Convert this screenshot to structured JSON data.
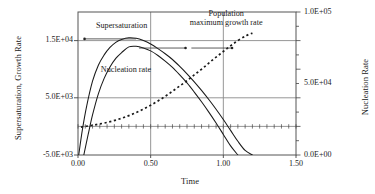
{
  "chart_data": {
    "type": "line",
    "title": "",
    "xlabel": "Time",
    "ylabel": "Supersaturation, Growth Rate",
    "ylabel_right": "Nucleation Rate",
    "xlim": [
      0.0,
      1.5
    ],
    "ylim": [
      -5000,
      20000
    ],
    "ylim_right": [
      0,
      100000
    ],
    "grid": true,
    "legend_position": "inline-annotations",
    "xticks": [
      "0.00",
      "0.50",
      "1.00",
      "1.50"
    ],
    "xtick_values": [
      0.0,
      0.5,
      1.0,
      1.5
    ],
    "yticks_left": [
      "-5.0E+03",
      "5.0E+03",
      "1.5E+04"
    ],
    "ytick_values_left": [
      -5000,
      5000,
      15000
    ],
    "yticks_right": [
      "0.0E+00",
      "5.0E+04",
      "1.0E+05"
    ],
    "ytick_values_right": [
      0,
      50000,
      100000
    ],
    "series": [
      {
        "name": "Supersaturation",
        "style": "solid",
        "axis": "left",
        "peak_x": 0.35,
        "peak_y": 15500,
        "x": [
          0.005,
          0.03,
          0.06,
          0.1,
          0.14,
          0.18,
          0.22,
          0.26,
          0.3,
          0.35,
          0.4,
          0.45,
          0.5,
          0.55,
          0.6,
          0.65,
          0.7,
          0.75,
          0.8,
          0.85,
          0.9,
          0.95,
          1.0,
          1.05,
          1.1,
          1.15,
          1.2
        ],
        "y": [
          -5000,
          -600,
          3600,
          7900,
          10700,
          12500,
          13800,
          14700,
          15200,
          15500,
          15400,
          15000,
          14400,
          13600,
          12700,
          11700,
          10500,
          9200,
          7800,
          6300,
          4700,
          3000,
          1200,
          -700,
          -2600,
          -4200,
          -5000
        ]
      },
      {
        "name": "Nucleation rate",
        "style": "solid",
        "axis": "right",
        "peak_x": 0.36,
        "peak_y": 14000,
        "x": [
          0.04,
          0.07,
          0.1,
          0.14,
          0.18,
          0.22,
          0.26,
          0.3,
          0.35,
          0.4,
          0.45,
          0.5,
          0.55,
          0.6,
          0.65,
          0.7,
          0.75,
          0.8,
          0.85,
          0.9,
          0.95,
          1.0,
          1.05,
          1.1
        ],
        "y": [
          -5000,
          -1400,
          2000,
          5700,
          8400,
          10400,
          11900,
          12900,
          13900,
          14000,
          13700,
          13200,
          12400,
          11400,
          10300,
          9000,
          7600,
          6000,
          4300,
          2500,
          600,
          -1400,
          -3400,
          -5000
        ]
      },
      {
        "name": "Population maximum growth rate",
        "style": "dotted",
        "axis": "left",
        "x": [
          0.02,
          0.08,
          0.14,
          0.2,
          0.26,
          0.32,
          0.38,
          0.44,
          0.5,
          0.56,
          0.62,
          0.68,
          0.74,
          0.8,
          0.86,
          0.92,
          0.98,
          1.04,
          1.1,
          1.16,
          1.2
        ],
        "y": [
          -120,
          120,
          380,
          700,
          1100,
          1600,
          2200,
          2900,
          3700,
          4600,
          5600,
          6700,
          7800,
          9000,
          10200,
          11500,
          12700,
          13900,
          15000,
          15900,
          16300
        ]
      }
    ],
    "annotations": [
      {
        "text": "Supersaturation",
        "lines": [
          "Supersaturation"
        ],
        "x": 0.3,
        "y": 17300,
        "leader_to_x": 0.045,
        "leader_to_y": 15300
      },
      {
        "text": "Nucleation rate",
        "lines": [
          "Nucleation rate"
        ],
        "x": 0.33,
        "y": 9700,
        "leader_to_x": 0.74,
        "leader_to_y": 13700
      },
      {
        "text": "Population maximum growth rate",
        "lines": [
          "Population",
          "maximum growth rate"
        ],
        "x": 1.02,
        "y": 18600,
        "leader_to_x": 1.06,
        "leader_to_y": 13700
      }
    ]
  },
  "axes": {
    "x_title": "Time",
    "y_title_left": "Supersaturation, Growth Rate",
    "y_title_right": "Nucleation Rate"
  },
  "colors": {
    "curve": "#1a1a1a",
    "grid": "#8a8a8a",
    "frame": "#555555",
    "text": "#1a1a1a",
    "background": "#ffffff"
  }
}
